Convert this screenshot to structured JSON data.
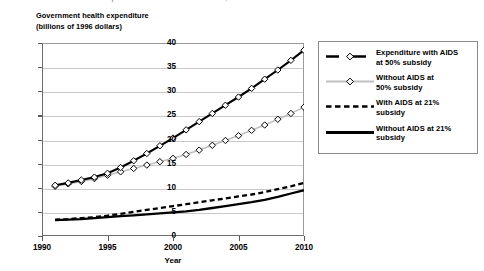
{
  "clipped_title": "Government health expenditure with and without AIDS, 1991–2010",
  "axis": {
    "ylabel_line1": "Government health expenditure",
    "ylabel_line2": "(billions of 1996 dollars)",
    "xlabel": "Year",
    "yticks": [
      "0",
      "5",
      "10",
      "15",
      "20",
      "25",
      "30",
      "35",
      "40"
    ],
    "xticks": [
      "1990",
      "1995",
      "2000",
      "2005",
      "2010"
    ]
  },
  "legend": {
    "items": [
      {
        "key": "line-marker-black",
        "label_line1": "Expenditure with AIDS",
        "label_line2": "at 50% subsidy",
        "color": "#000000"
      },
      {
        "key": "line-marker-gray",
        "label_line1": "Without AIDS at",
        "label_line2": "50% subsidy",
        "color": "#bfbfbf"
      },
      {
        "key": "line-dashed-black",
        "label_line1": "With AIDS at 21%",
        "label_line2": "subsidy",
        "color": "#000000"
      },
      {
        "key": "line-solid-black",
        "label_line1": "Without AIDS at 21%",
        "label_line2": "subsidy",
        "color": "#000000"
      }
    ]
  },
  "chart_data": {
    "type": "line",
    "title": "Government health expenditure with and without AIDS, 1991–2010",
    "xlabel": "Year",
    "ylabel": "Government health expenditure (billions of 1996 dollars)",
    "xlim": [
      1990,
      2010
    ],
    "ylim": [
      0,
      40
    ],
    "ytick_step": 5,
    "xtick_step": 5,
    "grid": "horizontal",
    "legend_position": "right-outside",
    "x": [
      1991,
      1992,
      1993,
      1994,
      1995,
      1996,
      1997,
      1998,
      1999,
      2000,
      2001,
      2002,
      2003,
      2004,
      2005,
      2006,
      2007,
      2008,
      2009,
      2010
    ],
    "series": [
      {
        "name": "Expenditure with AIDS at 50% subsidy",
        "color": "#000000",
        "style": "solid",
        "marker": "diamond",
        "values": [
          10.5,
          11.0,
          11.6,
          12.2,
          13.0,
          14.2,
          15.6,
          17.1,
          18.7,
          20.3,
          22.0,
          23.7,
          25.4,
          27.1,
          28.8,
          30.6,
          32.5,
          34.4,
          36.4,
          38.5
        ]
      },
      {
        "name": "Without AIDS at 50% subsidy",
        "color": "#bfbfbf",
        "style": "solid",
        "marker": "diamond",
        "values": [
          10.3,
          10.8,
          11.3,
          11.9,
          12.6,
          13.3,
          14.0,
          14.7,
          15.4,
          16.1,
          16.9,
          17.8,
          18.8,
          19.8,
          20.8,
          21.9,
          23.0,
          24.2,
          25.4,
          26.7
        ]
      },
      {
        "name": "With AIDS at 21% subsidy",
        "color": "#000000",
        "style": "dashed",
        "marker": "none",
        "values": [
          3.4,
          3.5,
          3.7,
          3.9,
          4.2,
          4.6,
          5.0,
          5.4,
          5.8,
          6.2,
          6.6,
          7.0,
          7.4,
          7.8,
          8.2,
          8.6,
          9.1,
          9.7,
          10.3,
          11.0
        ]
      },
      {
        "name": "Without AIDS at 21% subsidy",
        "color": "#000000",
        "style": "solid",
        "marker": "none",
        "values": [
          3.3,
          3.4,
          3.5,
          3.7,
          3.9,
          4.1,
          4.3,
          4.5,
          4.7,
          4.9,
          5.1,
          5.4,
          5.8,
          6.2,
          6.6,
          7.0,
          7.5,
          8.1,
          8.8,
          9.5
        ]
      }
    ]
  }
}
